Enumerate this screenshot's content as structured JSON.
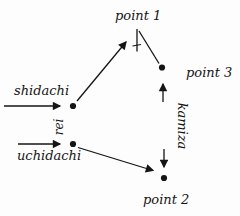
{
  "diagram": {
    "title_hint": "kata movement diagram",
    "labels": {
      "point1": "point 1",
      "point2": "point 2",
      "point3": "point 3",
      "shidachi": "shidachi",
      "uchidachi": "uchidachi",
      "rei": "rei",
      "kamiza": "kamiza"
    },
    "colors": {
      "ink": "#151515",
      "background": "#fdfdfd"
    }
  }
}
